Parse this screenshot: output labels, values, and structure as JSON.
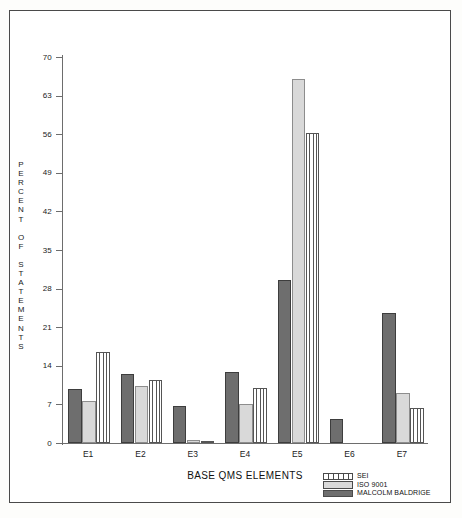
{
  "chart_data": {
    "type": "bar",
    "title": "",
    "xlabel": "BASE QMS ELEMENTS",
    "ylabel": "PERCENT OF STATEMENTS",
    "categories": [
      "E1",
      "E2",
      "E3",
      "E4",
      "E5",
      "E6",
      "E7"
    ],
    "ylim": [
      0,
      70
    ],
    "yticks": [
      0,
      7,
      14,
      21,
      28,
      35,
      42,
      49,
      56,
      63,
      70
    ],
    "ytick_labels": [
      "0",
      "7",
      "14",
      "21",
      "28",
      "35",
      "42",
      "49",
      "56",
      "63",
      "70"
    ],
    "grid": false,
    "legend_position": "bottom-right",
    "series": [
      {
        "name": "MALCOLM BALDRIGE",
        "color": "#6e6e6e",
        "pattern": "solid-dark",
        "values": [
          9.8,
          12.5,
          6.7,
          12.9,
          29.5,
          4.3,
          23.5
        ]
      },
      {
        "name": "ISO 9001",
        "color": "#d9d9d9",
        "pattern": "solid-light",
        "values": [
          7.6,
          10.3,
          0.5,
          7.1,
          66.0,
          0.0,
          9.1
        ]
      },
      {
        "name": "SEI",
        "color": "#ffffff",
        "pattern": "vertical-stripes",
        "values": [
          16.5,
          11.5,
          0.2,
          10.0,
          56.3,
          0.0,
          6.3
        ]
      }
    ]
  },
  "ylabel_letters": [
    "P",
    "E",
    "R",
    "C",
    "E",
    "N",
    "T",
    "",
    "O",
    "F",
    "",
    "S",
    "T",
    "A",
    "T",
    "E",
    "M",
    "E",
    "N",
    "T",
    "S"
  ],
  "legend": {
    "items": [
      {
        "label": "SEI",
        "swatch": "sei"
      },
      {
        "label": "ISO 9001",
        "swatch": "iso"
      },
      {
        "label": "MALCOLM BALDRIGE",
        "swatch": "mb"
      }
    ]
  }
}
